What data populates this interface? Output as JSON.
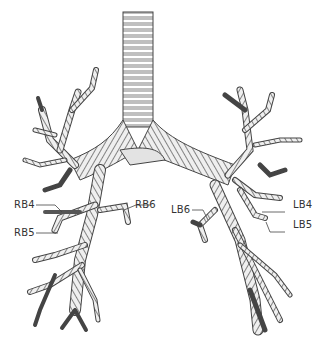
{
  "diagram": {
    "labels": {
      "rb4": "RB4",
      "rb5": "RB5",
      "rb6": "RB6",
      "lb4": "LB4",
      "lb5": "LB5",
      "lb6": "LB6"
    },
    "colors": {
      "outline": "#444444",
      "fill": "#e3e3e3",
      "ring": "#ffffff",
      "background": "#ffffff"
    }
  }
}
